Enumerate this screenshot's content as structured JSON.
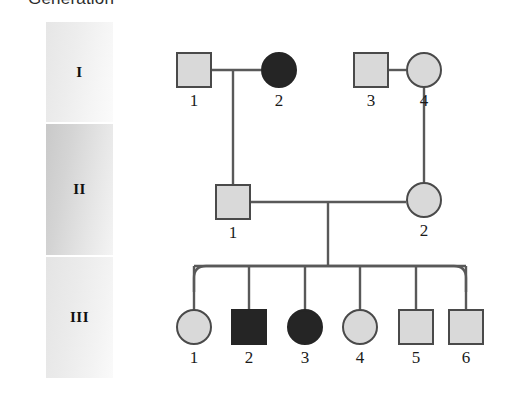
{
  "title": "Generation",
  "colors": {
    "affected_fill": "#252525",
    "unaffected_fill": "#d9d9d9",
    "symbol_stroke": "#4a4a4a",
    "line": "#595959",
    "band_generation_1": "#ededed",
    "band_generation_2": "#d4d4d4",
    "band_generation_3": "#ebebeb"
  },
  "generations": [
    {
      "label": "I"
    },
    {
      "label": "II"
    },
    {
      "label": "III"
    }
  ],
  "chart_data": {
    "type": "pedigree",
    "title": "Generation",
    "legend": {
      "filled": "affected",
      "unfilled": "unaffected"
    },
    "individuals": [
      {
        "generation": "I",
        "id": "1",
        "sex": "male",
        "shape": "square",
        "affected": false,
        "x": 194,
        "y": 70
      },
      {
        "generation": "I",
        "id": "2",
        "sex": "female",
        "shape": "circle",
        "affected": true,
        "x": 279,
        "y": 70
      },
      {
        "generation": "I",
        "id": "3",
        "sex": "male",
        "shape": "square",
        "affected": false,
        "x": 371,
        "y": 70
      },
      {
        "generation": "I",
        "id": "4",
        "sex": "female",
        "shape": "circle",
        "affected": false,
        "x": 424,
        "y": 70
      },
      {
        "generation": "II",
        "id": "1",
        "sex": "male",
        "shape": "square",
        "affected": false,
        "x": 233,
        "y": 202
      },
      {
        "generation": "II",
        "id": "2",
        "sex": "female",
        "shape": "circle",
        "affected": false,
        "x": 424,
        "y": 200
      },
      {
        "generation": "III",
        "id": "1",
        "sex": "female",
        "shape": "circle",
        "affected": false,
        "x": 194,
        "y": 327
      },
      {
        "generation": "III",
        "id": "2",
        "sex": "male",
        "shape": "square",
        "affected": true,
        "x": 249,
        "y": 327
      },
      {
        "generation": "III",
        "id": "3",
        "sex": "female",
        "shape": "circle",
        "affected": true,
        "x": 305,
        "y": 327
      },
      {
        "generation": "III",
        "id": "4",
        "sex": "female",
        "shape": "circle",
        "affected": false,
        "x": 360,
        "y": 327
      },
      {
        "generation": "III",
        "id": "5",
        "sex": "male",
        "shape": "square",
        "affected": false,
        "x": 416,
        "y": 327
      },
      {
        "generation": "III",
        "id": "6",
        "sex": "male",
        "shape": "square",
        "affected": false,
        "x": 466,
        "y": 327
      }
    ],
    "matings": [
      {
        "partners": [
          "I-1",
          "I-2"
        ],
        "children": [
          "II-1"
        ]
      },
      {
        "partners": [
          "I-3",
          "I-4"
        ],
        "children": [
          "II-2"
        ]
      },
      {
        "partners": [
          "II-1",
          "II-2"
        ],
        "children": [
          "III-1",
          "III-2",
          "III-3",
          "III-4",
          "III-5",
          "III-6"
        ]
      }
    ]
  }
}
